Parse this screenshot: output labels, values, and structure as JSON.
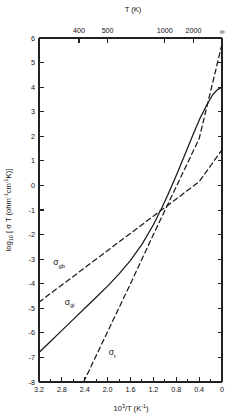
{
  "chart_data": {
    "type": "line",
    "title": "",
    "xlabel": "10^3/T (K^-1)",
    "ylabel": "log10 [ sigma T (ohm^-1 cm^-1 K) ]",
    "xlabel_parts": {
      "pre": "10",
      "sup": "3",
      "mid": "/T (K",
      "sup2": "-1",
      "post": ")"
    },
    "ylabel_parts": {
      "pre": "log",
      "sub": "10",
      "mid": " [ σ T (ohm",
      "sup1": "-1",
      "mid2": "cm",
      "sup2": "-1",
      "post": "K)]"
    },
    "top_axis_label": "T (K)",
    "xlim": [
      3.2,
      0.0
    ],
    "ylim": [
      -8,
      6
    ],
    "grid": false,
    "legend": "inline-labels",
    "x_ticks": [
      3.2,
      2.8,
      2.4,
      2.0,
      1.6,
      1.2,
      0.8,
      0.4,
      0.0
    ],
    "x_tick_labels": [
      "3.2",
      "2.8",
      "2.4",
      "2.0",
      "1.6",
      "1.2",
      "0.8",
      "0.4",
      "0"
    ],
    "x_minor_ticks": [
      3.0,
      2.6,
      2.2,
      1.8,
      1.4,
      1.0,
      0.6,
      0.2
    ],
    "y_ticks": [
      6,
      5,
      4,
      3,
      2,
      1,
      0,
      -1,
      -2,
      -3,
      -4,
      -5,
      -6,
      -7,
      -8
    ],
    "y_tick_labels": [
      "6",
      "5",
      "4",
      "3",
      "2",
      "1",
      "0",
      "-1",
      "-2",
      "-3",
      "-4",
      "-5",
      "-6",
      "-7",
      "-8"
    ],
    "top_ticks": [
      {
        "x": 2.5,
        "label": "400"
      },
      {
        "x": 2.0,
        "label": "500"
      },
      {
        "x": 1.0,
        "label": "1000"
      },
      {
        "x": 0.5,
        "label": "2000"
      },
      {
        "x": 0.0,
        "label": "∞"
      }
    ],
    "series": [
      {
        "name": "sigma_gb",
        "label": "σ",
        "label_sub": "gb",
        "style": "dashed",
        "comment": "grain boundary conductivity - shallow dashed line",
        "points": [
          [
            3.2,
            -4.75
          ],
          [
            2.8,
            -4.05
          ],
          [
            2.4,
            -3.35
          ],
          [
            2.0,
            -2.65
          ],
          [
            1.6,
            -1.95
          ],
          [
            1.2,
            -1.25
          ],
          [
            0.8,
            -0.55
          ],
          [
            0.4,
            0.15
          ],
          [
            0.0,
            1.45
          ]
        ],
        "x": [
          3.2,
          0.0
        ],
        "y": [
          -4.75,
          1.45
        ]
      },
      {
        "name": "sigma_gi",
        "label": "σ",
        "label_sub": "gi",
        "style": "dashed",
        "comment": "grain interior conductivity - steep dashed line",
        "points": [
          [
            2.42,
            -8.0
          ],
          [
            2.0,
            -5.95
          ],
          [
            1.6,
            -4.0
          ],
          [
            1.2,
            -2.0
          ],
          [
            0.8,
            -0.05
          ],
          [
            0.4,
            1.9
          ],
          [
            0.0,
            5.75
          ]
        ],
        "x": [
          2.42,
          0.0
        ],
        "y": [
          -8.0,
          5.75
        ]
      },
      {
        "name": "sigma_t",
        "label": "σ",
        "label_sub": "t",
        "style": "solid",
        "comment": "total conductivity - solid curve, follows sigma_gi at high T and sigma_gb at low T",
        "points": [
          [
            3.2,
            -6.8
          ],
          [
            3.0,
            -6.35
          ],
          [
            2.8,
            -5.9
          ],
          [
            2.6,
            -5.45
          ],
          [
            2.4,
            -5.0
          ],
          [
            2.2,
            -4.55
          ],
          [
            2.0,
            -4.1
          ],
          [
            1.8,
            -3.6
          ],
          [
            1.6,
            -3.05
          ],
          [
            1.4,
            -2.4
          ],
          [
            1.2,
            -1.6
          ],
          [
            1.05,
            -0.9
          ],
          [
            0.95,
            -0.4
          ],
          [
            0.8,
            0.4
          ],
          [
            0.65,
            1.25
          ],
          [
            0.5,
            2.1
          ],
          [
            0.38,
            2.75
          ],
          [
            0.26,
            3.3
          ],
          [
            0.16,
            3.7
          ],
          [
            0.08,
            3.9
          ],
          [
            0.0,
            4.0
          ]
        ]
      }
    ],
    "annotations": [
      {
        "name": "sigma_gb_label",
        "x": 2.95,
        "y": -3.25
      },
      {
        "name": "sigma_t_label",
        "x": 2.75,
        "y": -4.85
      },
      {
        "name": "sigma_gi_label",
        "x": 1.98,
        "y": -6.9
      }
    ],
    "colors": {
      "axis": "#222222",
      "curve": "#1a1a1a",
      "background": "#ffffff"
    }
  }
}
